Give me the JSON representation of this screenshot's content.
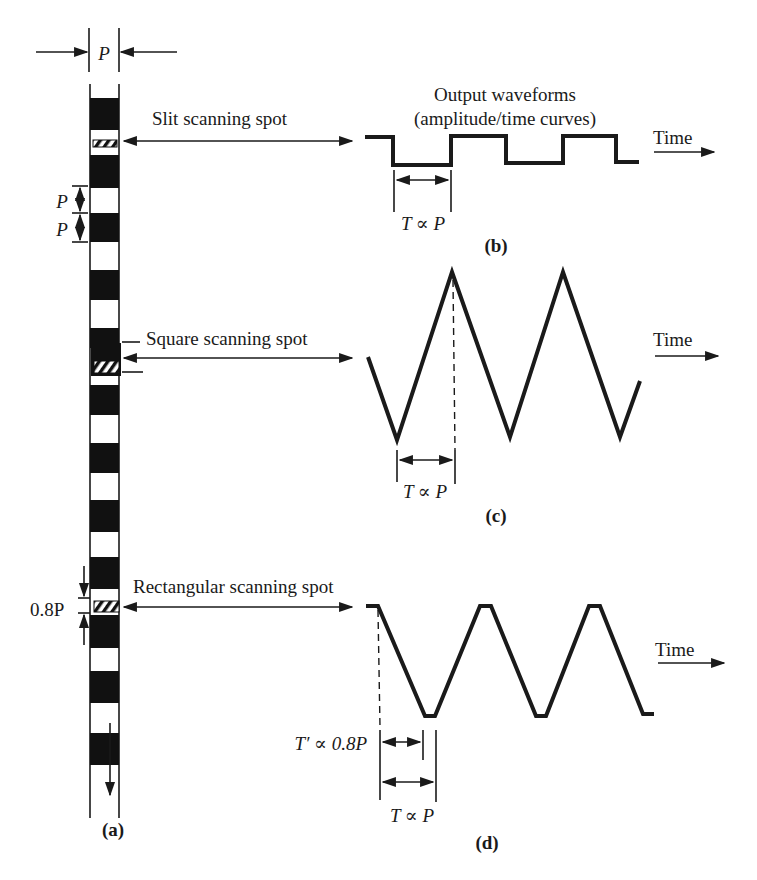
{
  "figure": {
    "header": {
      "line1": "Output waveforms",
      "line2": "(amplitude/time curves)"
    },
    "strip": {
      "pitch_label": "P",
      "pitch_label_a": "P",
      "pitch_label_b": "P",
      "rect_height_label": "0.8P",
      "direction": "downward",
      "caption": "(a)"
    },
    "panels": [
      {
        "id": "b",
        "spot_label": "Slit scanning spot",
        "waveform": "square",
        "time_label": "Time",
        "period_label": "T ∝ P",
        "caption": "(b)"
      },
      {
        "id": "c",
        "spot_label": "Square scanning spot",
        "waveform": "triangle",
        "time_label": "Time",
        "period_label": "T ∝ P",
        "caption": "(c)"
      },
      {
        "id": "d",
        "spot_label": "Rectangular scanning spot",
        "waveform": "trapezoid",
        "time_label": "Time",
        "short_period_label": "T′ ∝ 0.8P",
        "period_label": "T ∝ P",
        "caption": "(d)"
      }
    ]
  },
  "colors": {
    "ink": "#1a1a1a",
    "background": "#ffffff"
  }
}
